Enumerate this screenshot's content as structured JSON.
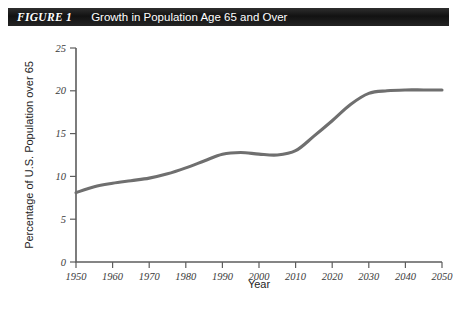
{
  "figure": {
    "label": "FIGURE 1",
    "title": "Growth in Population Age 65 and Over"
  },
  "colors": {
    "banner_background": "#171717",
    "banner_text": "#ffffff",
    "line": "#6f6f6f",
    "axis": "#5d5d5d",
    "tick_text": "#3a3a3a",
    "page_background": "#ffffff"
  },
  "source_caption": "",
  "chart_data": {
    "type": "line",
    "title": "Growth in Population Age 65 and Over",
    "xlabel": "Year",
    "ylabel": "Percentage of U.S. Population over 65",
    "xlim": [
      1950,
      2050
    ],
    "ylim": [
      0,
      25
    ],
    "xticks": [
      1950,
      1960,
      1970,
      1980,
      1990,
      2000,
      2010,
      2020,
      2030,
      2040,
      2050
    ],
    "yticks": [
      0,
      5,
      10,
      15,
      20,
      25
    ],
    "grid": false,
    "legend": false,
    "x": [
      1950,
      1955,
      1960,
      1965,
      1970,
      1975,
      1980,
      1985,
      1990,
      1995,
      2000,
      2005,
      2010,
      2015,
      2020,
      2025,
      2030,
      2035,
      2040,
      2045,
      2050
    ],
    "values": [
      8.1,
      8.8,
      9.2,
      9.5,
      9.8,
      10.3,
      11.0,
      11.8,
      12.6,
      12.8,
      12.6,
      12.5,
      13.0,
      14.7,
      16.5,
      18.4,
      19.7,
      20.0,
      20.1,
      20.1,
      20.1
    ],
    "series": [
      {
        "name": "Percentage of U.S. Population over 65",
        "values": [
          8.1,
          8.8,
          9.2,
          9.5,
          9.8,
          10.3,
          11.0,
          11.8,
          12.6,
          12.8,
          12.6,
          12.5,
          13.0,
          14.7,
          16.5,
          18.4,
          19.7,
          20.0,
          20.1,
          20.1,
          20.1
        ]
      }
    ]
  }
}
